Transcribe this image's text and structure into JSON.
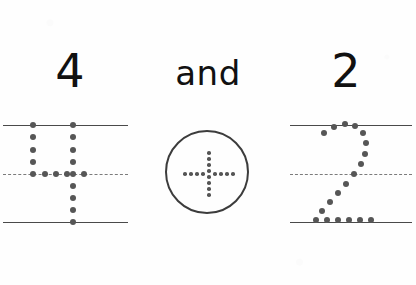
{
  "worksheet": {
    "type": "number-tracing-practice",
    "background_color": "#fefefe",
    "ink_color": "#111111",
    "rule_color": "#4a4a4a",
    "dash_color": "#7b7b7b",
    "dot_color": "#565656"
  },
  "left": {
    "numeral": "4",
    "dots_label": "dotted-tracing-numeral-4",
    "rules": {
      "top_label": "top-rule",
      "mid_label": "mid-dashed-rule",
      "bottom_label": "baseline-rule"
    },
    "trace_dots": [
      {
        "x": 33,
        "y": 125
      },
      {
        "x": 33,
        "y": 137
      },
      {
        "x": 33,
        "y": 150
      },
      {
        "x": 33,
        "y": 162
      },
      {
        "x": 33,
        "y": 174
      },
      {
        "x": 45,
        "y": 174
      },
      {
        "x": 56,
        "y": 174
      },
      {
        "x": 67,
        "y": 174
      },
      {
        "x": 73,
        "y": 174
      },
      {
        "x": 84,
        "y": 174
      },
      {
        "x": 73,
        "y": 125
      },
      {
        "x": 73,
        "y": 137
      },
      {
        "x": 73,
        "y": 150
      },
      {
        "x": 73,
        "y": 162
      },
      {
        "x": 73,
        "y": 186
      },
      {
        "x": 73,
        "y": 198
      },
      {
        "x": 73,
        "y": 210
      },
      {
        "x": 73,
        "y": 222
      }
    ]
  },
  "middle": {
    "conjunction": "and",
    "operator": "plus",
    "operator_label": "circled-dotted-plus-operator",
    "plus_dots": [
      {
        "x": 42,
        "y": 21
      },
      {
        "x": 42,
        "y": 27
      },
      {
        "x": 42,
        "y": 33
      },
      {
        "x": 42,
        "y": 39
      },
      {
        "x": 42,
        "y": 45
      },
      {
        "x": 42,
        "y": 51
      },
      {
        "x": 42,
        "y": 57
      },
      {
        "x": 42,
        "y": 63
      },
      {
        "x": 18,
        "y": 42
      },
      {
        "x": 24,
        "y": 42
      },
      {
        "x": 30,
        "y": 42
      },
      {
        "x": 36,
        "y": 42
      },
      {
        "x": 48,
        "y": 42
      },
      {
        "x": 54,
        "y": 42
      },
      {
        "x": 60,
        "y": 42
      },
      {
        "x": 66,
        "y": 42
      }
    ]
  },
  "right": {
    "numeral": "2",
    "dots_label": "dotted-tracing-numeral-2",
    "rules": {
      "top_label": "top-rule",
      "mid_label": "mid-dashed-rule",
      "bottom_label": "baseline-rule"
    },
    "trace_dots": [
      {
        "x": 48,
        "y": 133
      },
      {
        "x": 58,
        "y": 127
      },
      {
        "x": 69,
        "y": 124
      },
      {
        "x": 79,
        "y": 126
      },
      {
        "x": 87,
        "y": 133
      },
      {
        "x": 90,
        "y": 143
      },
      {
        "x": 89,
        "y": 154
      },
      {
        "x": 85,
        "y": 164
      },
      {
        "x": 78,
        "y": 174
      },
      {
        "x": 70,
        "y": 184
      },
      {
        "x": 62,
        "y": 193
      },
      {
        "x": 54,
        "y": 202
      },
      {
        "x": 46,
        "y": 211
      },
      {
        "x": 40,
        "y": 220
      },
      {
        "x": 51,
        "y": 220
      },
      {
        "x": 62,
        "y": 220
      },
      {
        "x": 73,
        "y": 220
      },
      {
        "x": 84,
        "y": 220
      },
      {
        "x": 95,
        "y": 220
      }
    ]
  }
}
